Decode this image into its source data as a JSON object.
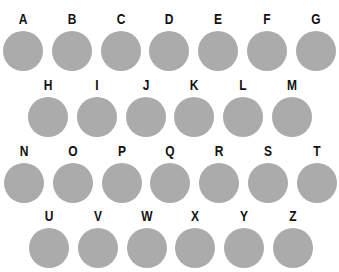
{
  "colors": {
    "circle": "#ababab",
    "label": "#111111",
    "background": "#ffffff"
  },
  "rows": [
    {
      "offset_x": 2,
      "top": 11,
      "letters": [
        "A",
        "B",
        "C",
        "D",
        "E",
        "F",
        "G"
      ]
    },
    {
      "offset_x": 27,
      "top": 77,
      "letters": [
        "H",
        "I",
        "J",
        "K",
        "L",
        "M"
      ]
    },
    {
      "offset_x": 3,
      "top": 143,
      "letters": [
        "N",
        "O",
        "P",
        "Q",
        "R",
        "S",
        "T"
      ]
    },
    {
      "offset_x": 28,
      "top": 208,
      "letters": [
        "U",
        "V",
        "W",
        "X",
        "Y",
        "Z"
      ]
    }
  ]
}
